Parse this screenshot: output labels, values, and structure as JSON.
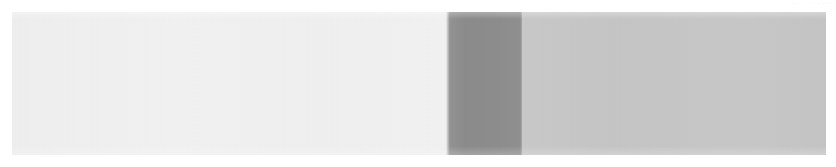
{
  "page": {
    "background_color": "#ffffff",
    "width": 836,
    "height": 167
  },
  "top_fragment": {
    "text": "·· ··· ····",
    "color": "#f2f2f3"
  },
  "content_strip": {
    "label": "scanned content strip",
    "bands": [
      {
        "name": "light-band",
        "label": "",
        "color": "#f0f0f1",
        "width_px": 436
      },
      {
        "name": "dark-band",
        "label": "",
        "color": "#8d8d8d",
        "width_px": 74
      },
      {
        "name": "mid-band",
        "label": "",
        "color": "#c6c6c7",
        "width_px": 304
      }
    ]
  }
}
